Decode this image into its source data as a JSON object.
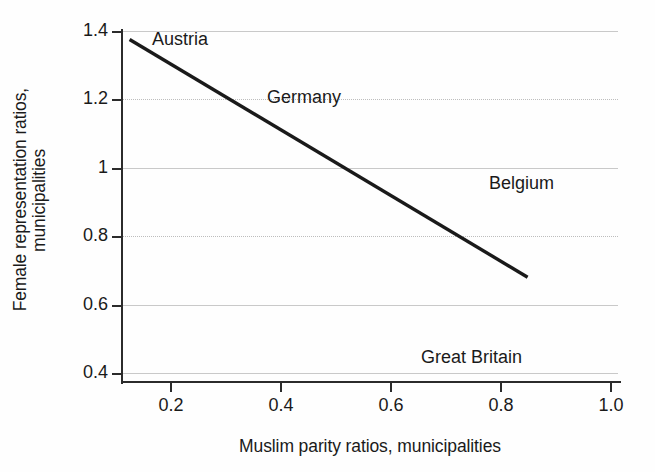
{
  "chart_data": {
    "type": "line",
    "title": "",
    "subtitle": "",
    "xlabel": "Muslim parity ratios, municipalities",
    "ylabel_line1": "Female representation ratios,",
    "ylabel_line2": "municipalities",
    "ylabel": "Female representation ratios, municipalities",
    "xlim": [
      0.06,
      0.96
    ],
    "ylim": [
      0.38,
      1.44
    ],
    "xticks": [
      0.2,
      0.4,
      0.6,
      0.8,
      1.0
    ],
    "xtick_labels": [
      "0.2",
      "0.4",
      "0.6",
      "0.8",
      "1.0"
    ],
    "yticks": [
      0.4,
      0.6,
      0.8,
      1.0,
      1.2,
      1.4
    ],
    "ytick_labels": [
      "0.4",
      "0.6",
      "0.8",
      "1",
      "1.2",
      "1.4"
    ],
    "grid": "horizontal",
    "legend": "none",
    "series": [
      {
        "name": "fitted-regression-line",
        "color": "#1a1a1a",
        "x": [
          0.125,
          0.85
        ],
        "values": [
          1.375,
          0.68
        ]
      }
    ],
    "annotations": [
      {
        "text": "Austria",
        "x": 0.185,
        "y": 1.345
      },
      {
        "text": "Germany",
        "x": 0.39,
        "y": 1.21
      },
      {
        "text": "Belgium",
        "x": 0.77,
        "y": 0.955
      },
      {
        "text": "Great Britain",
        "x": 0.635,
        "y": 0.44
      }
    ],
    "colors": {
      "line": "#1a1a1a",
      "axis": "#2b2b2b",
      "grid": "#c9c9c9",
      "background": "#fefefe",
      "text": "#1a1a1a"
    }
  }
}
